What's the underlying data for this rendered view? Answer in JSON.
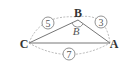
{
  "diagram": {
    "type": "triangle",
    "vertices": {
      "A": {
        "label": "A"
      },
      "B": {
        "label": "B"
      },
      "C": {
        "label": "C"
      }
    },
    "angle_label": "B",
    "sides": [
      {
        "between": "C-B",
        "length_label": "5"
      },
      {
        "between": "B-A",
        "length_label": "3"
      },
      {
        "between": "C-A",
        "length_label": "7"
      }
    ],
    "colors": {
      "line": "#666666",
      "dashed": "#999999",
      "text": "#333333"
    }
  }
}
